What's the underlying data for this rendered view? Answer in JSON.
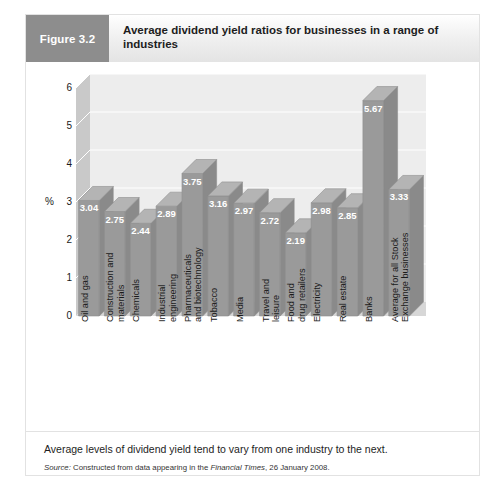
{
  "figure": {
    "tag": "Figure 3.2",
    "title": "Average dividend yield ratios for businesses in a range of industries",
    "caption": "Average levels of dividend yield tend to vary from one industry to the next.",
    "source_prefix": "Source:",
    "source_text_a": "Constructed from data appearing in the",
    "source_publication": "Financial Times",
    "source_text_b": ", 26 January 2008."
  },
  "colors": {
    "tag_background": "#8d8d8d",
    "bar_front": "#9a9a9a",
    "bar_side": "#8a8a8a",
    "bar_top": "#b4b4b4",
    "back_wall": "#ededed",
    "left_wall": "#c9c9c9",
    "floor": "#d7d7d7",
    "gridline": "#ffffff",
    "value_label": "#ffffff",
    "text": "#1a1a1a"
  },
  "chart_data": {
    "type": "bar",
    "title": "Average dividend yield ratios for businesses in a range of industries",
    "xlabel": "",
    "ylabel": "%",
    "ylim": [
      0,
      6
    ],
    "yticks": [
      0,
      1,
      2,
      3,
      4,
      5,
      6
    ],
    "ytick_labels": [
      "0",
      "1",
      "2",
      "3",
      "4",
      "5",
      "6"
    ],
    "grid": true,
    "legend": false,
    "three_d": true,
    "categories": [
      "Oil and gas",
      "Construction and materials",
      "Chemicals",
      "Industrial engineering",
      "Pharmaceuticals and biotechnology",
      "Tobacco",
      "Media",
      "Travel and leisure",
      "Food and drug retailers",
      "Electricity",
      "Real estate",
      "Banks",
      "Average for all Stock Exchange businesses"
    ],
    "category_lines": [
      [
        "Oil and gas"
      ],
      [
        "Construction and",
        "materials"
      ],
      [
        "Chemicals"
      ],
      [
        "Industrial",
        "engineering"
      ],
      [
        "Pharmaceuticals",
        "and biotechnology"
      ],
      [
        "Tobacco"
      ],
      [
        "Media"
      ],
      [
        "Travel and",
        "leisure"
      ],
      [
        "Food and",
        "drug retailers"
      ],
      [
        "Electricity"
      ],
      [
        "Real estate"
      ],
      [
        "Banks"
      ],
      [
        "Average for all Stock",
        "Exchange businesses"
      ]
    ],
    "values": [
      3.04,
      2.75,
      2.44,
      2.89,
      3.75,
      3.16,
      2.97,
      2.72,
      2.19,
      2.98,
      2.85,
      5.67,
      3.33
    ],
    "value_labels": [
      "3.04",
      "2.75",
      "2.44",
      "2.89",
      "3.75",
      "3.16",
      "2.97",
      "2.72",
      "2.19",
      "2.98",
      "2.85",
      "5.67",
      "3.33"
    ]
  }
}
